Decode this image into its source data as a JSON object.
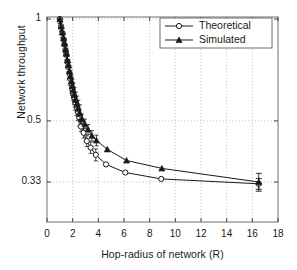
{
  "chart_data": {
    "type": "line",
    "title": "",
    "xlabel": "Hop-radius of network (R)",
    "ylabel": "Network throughput",
    "xlim": [
      0,
      18
    ],
    "ylim": [
      0.27,
      1.0
    ],
    "xticks": [
      0,
      2,
      4,
      6,
      8,
      10,
      12,
      14,
      16,
      18
    ],
    "xtick_labels": [
      "0",
      "2",
      "4",
      "6",
      "8",
      "10",
      "12",
      "14",
      "16",
      "18"
    ],
    "yticks": [
      0.33,
      0.5,
      1
    ],
    "ytick_labels": [
      "0.33",
      "0.5",
      "1"
    ],
    "grid": "dotted-both",
    "legend_position": "top-right",
    "series": [
      {
        "name": "Theoretical",
        "marker": "open-circle",
        "color": "#1a1a1a",
        "points": [
          {
            "x": 1.0,
            "y": 1.0
          },
          {
            "x": 1.1,
            "y": 0.952
          },
          {
            "x": 1.2,
            "y": 0.909
          },
          {
            "x": 1.3,
            "y": 0.87
          },
          {
            "x": 1.35,
            "y": 0.84
          },
          {
            "x": 1.45,
            "y": 0.806
          },
          {
            "x": 1.5,
            "y": 0.784
          },
          {
            "x": 1.6,
            "y": 0.746
          },
          {
            "x": 1.65,
            "y": 0.722
          },
          {
            "x": 1.75,
            "y": 0.69
          },
          {
            "x": 1.8,
            "y": 0.667
          },
          {
            "x": 1.9,
            "y": 0.645
          },
          {
            "x": 1.95,
            "y": 0.625
          },
          {
            "x": 2.0,
            "y": 0.606
          },
          {
            "x": 2.1,
            "y": 0.588
          },
          {
            "x": 2.2,
            "y": 0.568
          },
          {
            "x": 2.3,
            "y": 0.549
          },
          {
            "x": 2.4,
            "y": 0.532
          },
          {
            "x": 2.5,
            "y": 0.513
          },
          {
            "x": 2.65,
            "y": 0.481
          },
          {
            "x": 2.85,
            "y": 0.461
          },
          {
            "x": 3.1,
            "y": 0.436
          },
          {
            "x": 3.4,
            "y": 0.417
          },
          {
            "x": 3.8,
            "y": 0.397
          },
          {
            "x": 4.6,
            "y": 0.372
          },
          {
            "x": 6.1,
            "y": 0.352
          },
          {
            "x": 8.9,
            "y": 0.337
          },
          {
            "x": 16.5,
            "y": 0.326
          }
        ],
        "errorbars": [
          {
            "x": 16.5,
            "y": 0.326,
            "err": 0.012
          }
        ]
      },
      {
        "name": "Simulated",
        "marker": "filled-triangle",
        "color": "#1a1a1a",
        "points": [
          {
            "x": 1.0,
            "y": 0.998
          },
          {
            "x": 1.1,
            "y": 0.95
          },
          {
            "x": 1.2,
            "y": 0.912
          },
          {
            "x": 1.3,
            "y": 0.876
          },
          {
            "x": 1.38,
            "y": 0.846
          },
          {
            "x": 1.46,
            "y": 0.812
          },
          {
            "x": 1.52,
            "y": 0.79
          },
          {
            "x": 1.6,
            "y": 0.754
          },
          {
            "x": 1.68,
            "y": 0.73
          },
          {
            "x": 1.76,
            "y": 0.7
          },
          {
            "x": 1.84,
            "y": 0.676
          },
          {
            "x": 1.92,
            "y": 0.654
          },
          {
            "x": 1.98,
            "y": 0.634
          },
          {
            "x": 2.06,
            "y": 0.616
          },
          {
            "x": 2.14,
            "y": 0.598
          },
          {
            "x": 2.24,
            "y": 0.578
          },
          {
            "x": 2.34,
            "y": 0.562
          },
          {
            "x": 2.44,
            "y": 0.545
          },
          {
            "x": 2.56,
            "y": 0.528
          },
          {
            "x": 2.72,
            "y": 0.508
          },
          {
            "x": 2.95,
            "y": 0.49
          },
          {
            "x": 3.2,
            "y": 0.472
          },
          {
            "x": 3.5,
            "y": 0.452
          },
          {
            "x": 3.85,
            "y": 0.438
          },
          {
            "x": 4.7,
            "y": 0.412
          },
          {
            "x": 6.2,
            "y": 0.382
          },
          {
            "x": 8.95,
            "y": 0.362
          },
          {
            "x": 16.5,
            "y": 0.33
          }
        ],
        "errorbars": [
          {
            "x": 16.5,
            "y": 0.33,
            "err": 0.02
          }
        ]
      }
    ],
    "legend": [
      {
        "label": "Theoretical",
        "marker": "open-circle"
      },
      {
        "label": "Simulated",
        "marker": "filled-triangle"
      }
    ]
  }
}
